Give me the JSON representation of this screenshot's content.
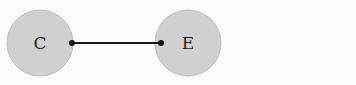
{
  "diagram": {
    "nodes": [
      {
        "id": "C",
        "label": "C",
        "cx": 40,
        "cy": 43,
        "r": 33
      },
      {
        "id": "E",
        "label": "E",
        "cx": 188,
        "cy": 43,
        "r": 33
      }
    ],
    "edges": [
      {
        "from": "C",
        "to": "E",
        "x1": 72,
        "x2": 161,
        "y": 43
      }
    ],
    "colors": {
      "node_fill": "#d0d0d0",
      "node_stroke": "#b8b8b8",
      "edge": "#1a1a1a",
      "background": "#fbfbfb"
    }
  }
}
